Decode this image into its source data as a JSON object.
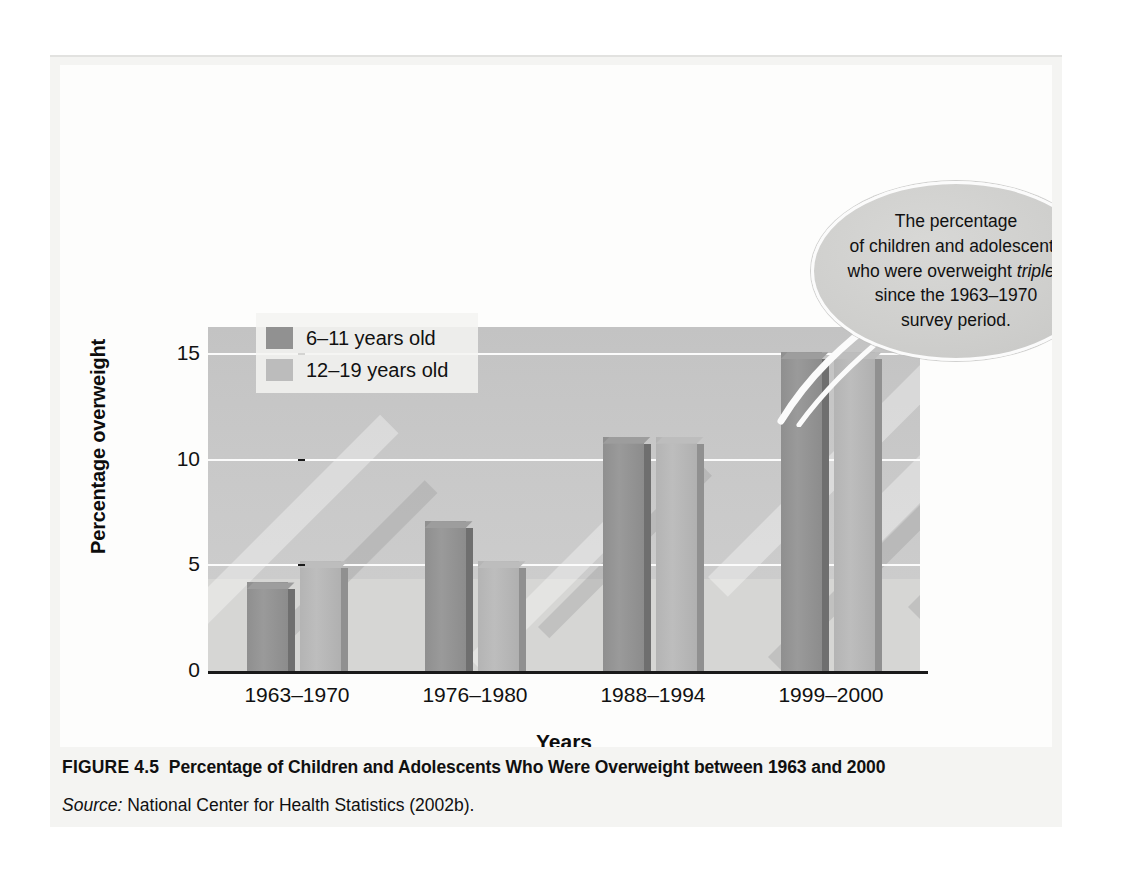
{
  "figure": {
    "caption_label": "FIGURE 4.5",
    "caption_title": "Percentage of Children and Adolescents Who Were Overweight between 1963 and 2000",
    "source_label": "Source:",
    "source_text": "National Center for Health Statistics (2002b)."
  },
  "callout": {
    "line1": "The percentage",
    "line2": "of children and adolescents",
    "line3_a": "who were overweight ",
    "line3_em": "tripled",
    "line4": "since the 1963–1970",
    "line5": "survey period."
  },
  "legend": {
    "items": [
      {
        "label": "6–11 years old",
        "color": "#919191"
      },
      {
        "label": "12–19 years old",
        "color": "#bcbcbc"
      }
    ]
  },
  "chart_data": {
    "type": "bar",
    "title": "Percentage of Children and Adolescents Who Were Overweight between 1963 and 2000",
    "xlabel": "Years",
    "ylabel": "Percentage overweight",
    "categories": [
      "1963–1970",
      "1976–1980",
      "1988–1994",
      "1999–2000"
    ],
    "series": [
      {
        "name": "6–11 years old",
        "color": "#919191",
        "values": [
          4.2,
          7.1,
          11.1,
          15.1
        ]
      },
      {
        "name": "12–19 years old",
        "color": "#bcbcbc",
        "values": [
          5.2,
          5.2,
          11.1,
          15.1
        ]
      }
    ],
    "ylim": [
      0,
      16.3
    ],
    "yticks": [
      0,
      5,
      10,
      15
    ],
    "ytick_labels": [
      "0",
      "5",
      "10",
      "15"
    ],
    "grid": true,
    "legend_position": "top-left"
  }
}
